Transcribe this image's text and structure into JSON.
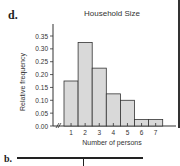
{
  "panel_label": "d.",
  "next_panel_label": "b.",
  "chart_data": {
    "type": "bar",
    "title": "Household Size",
    "xlabel": "Number of persons",
    "ylabel": "Relative frequency",
    "categories": [
      "1",
      "2",
      "3",
      "4",
      "5",
      "6",
      "7"
    ],
    "values": [
      0.175,
      0.325,
      0.225,
      0.125,
      0.1,
      0.025,
      0.025
    ],
    "yticks": [
      "0.00",
      "0.05",
      "0.10",
      "0.15",
      "0.20",
      "0.25",
      "0.30",
      "0.35"
    ],
    "ylim": [
      0,
      0.35
    ],
    "grid": false,
    "axis_break": true,
    "bar_color": "#d9d9d9",
    "edge_color": "#333333"
  }
}
